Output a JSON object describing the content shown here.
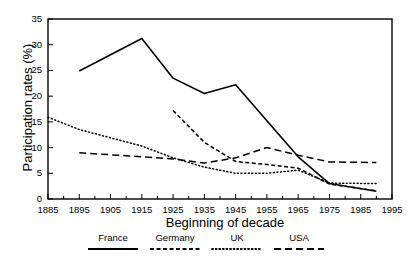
{
  "chart_data": {
    "type": "line",
    "title": "",
    "xlabel": "Beginning of decade",
    "ylabel": "Participation rates (%)",
    "xlim": [
      1885,
      1995
    ],
    "ylim": [
      0,
      35
    ],
    "xticks": [
      1885,
      1895,
      1905,
      1915,
      1925,
      1935,
      1945,
      1955,
      1965,
      1975,
      1985,
      1995
    ],
    "yticks": [
      0,
      5,
      10,
      15,
      20,
      25,
      30,
      35
    ],
    "minor_xtick_step": 5,
    "grid": false,
    "legend_position": "bottom",
    "series": [
      {
        "name": "France",
        "style": "solid",
        "x": [
          1895,
          1915,
          1925,
          1935,
          1945,
          1965,
          1975,
          1990
        ],
        "values": [
          24.9,
          31.2,
          23.5,
          20.5,
          22.2,
          8.2,
          3.0,
          1.5
        ]
      },
      {
        "name": "Germany",
        "style": "dash-dot",
        "x": [
          1925,
          1935,
          1945,
          1955,
          1965,
          1975,
          1990
        ],
        "values": [
          17.2,
          11.0,
          7.3,
          6.7,
          6.0,
          2.9,
          1.6
        ]
      },
      {
        "name": "UK",
        "style": "dotted",
        "x": [
          1885,
          1895,
          1905,
          1915,
          1925,
          1935,
          1945,
          1955,
          1965,
          1975,
          1990
        ],
        "values": [
          15.9,
          13.5,
          11.9,
          10.3,
          8.0,
          6.2,
          5.0,
          5.0,
          5.6,
          3.1,
          3.0
        ]
      },
      {
        "name": "USA",
        "style": "dashed",
        "x": [
          1895,
          1905,
          1915,
          1925,
          1935,
          1945,
          1955,
          1965,
          1975,
          1990
        ],
        "values": [
          9.0,
          8.6,
          8.2,
          7.8,
          7.0,
          8.0,
          10.0,
          8.5,
          7.2,
          7.1
        ]
      }
    ]
  },
  "legend": {
    "items": [
      {
        "label": "France"
      },
      {
        "label": "Germany"
      },
      {
        "label": "UK"
      },
      {
        "label": "USA"
      }
    ]
  },
  "colors": {
    "line": "#000000",
    "background": "#ffffff",
    "axis": "#000000"
  }
}
